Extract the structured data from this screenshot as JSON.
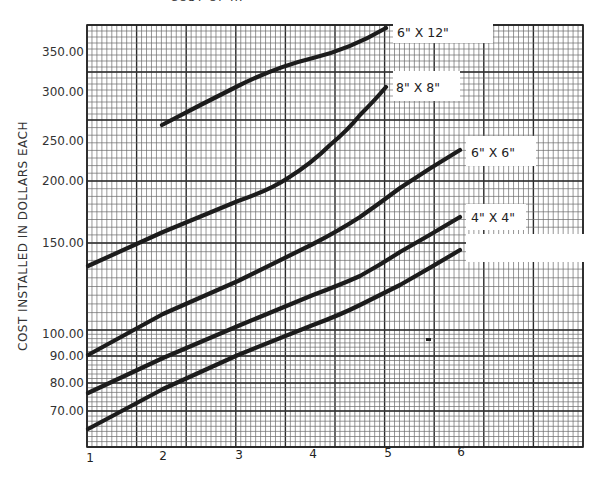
{
  "title": "COST OF ...",
  "chart_data": {
    "type": "line",
    "title": "COST OF ...",
    "xlabel": "",
    "ylabel": "COST INSTALLED IN DOLLARS EACH",
    "y_scale": "log",
    "x_ticks": [
      "1",
      "2",
      "3",
      "4",
      "5",
      "6"
    ],
    "y_ticks": [
      "350.00",
      "300.00",
      "250.00",
      "200.00",
      "150.00",
      "100.00",
      "90.00",
      "80.00",
      "70.00"
    ],
    "ylim": [
      60,
      380
    ],
    "xlim": [
      1,
      7.6
    ],
    "grid": true,
    "legend_position": "inline-right",
    "series": [
      {
        "name": "6\" X 12\"",
        "x": [
          2,
          3,
          4,
          5
        ],
        "values": [
          255,
          305,
          345,
          380
        ]
      },
      {
        "name": "8\" X 8\"",
        "x": [
          1,
          2,
          3,
          3.7,
          4.3,
          4.7,
          5
        ],
        "values": [
          135,
          157,
          178,
          192,
          222,
          255,
          300
        ]
      },
      {
        "name": "6\" X 6\"",
        "x": [
          1,
          2,
          3,
          4,
          4.6,
          5.2,
          6
        ],
        "values": [
          90,
          107,
          125,
          146,
          163,
          185,
          225
        ]
      },
      {
        "name": "4\" X 4\"",
        "x": [
          1,
          2,
          3,
          4,
          4.6,
          5.2,
          6
        ],
        "values": [
          77,
          89,
          102,
          116,
          125,
          139,
          165
        ]
      },
      {
        "name": "2-1/2\" X 2-1/2\"",
        "x": [
          1,
          2,
          3,
          4,
          4.6,
          5.2,
          6
        ],
        "values": [
          66,
          77,
          89,
          102,
          110,
          119,
          143
        ]
      }
    ]
  },
  "labels": {
    "curve_6x12": "6\" X 12\"",
    "curve_8x8": "8\" X 8\"",
    "curve_6x6": "6\" X 6\"",
    "curve_4x4": "4\" X 4\"",
    "curve_2h": "2-1/2\" X 2-1/2\"",
    "ylabel": "COST INSTALLED IN DOLLARS EACH",
    "y350": "350.00",
    "y300": "300.00",
    "y250": "250.00",
    "y200": "200.00",
    "y150": "150.00",
    "y100": "100.00",
    "y90": "90.00",
    "y80": "80.00",
    "y70": "70.00",
    "x1": "1",
    "x2": "2",
    "x3": "3",
    "x4": "4",
    "x5": "5",
    "x6": "6"
  }
}
